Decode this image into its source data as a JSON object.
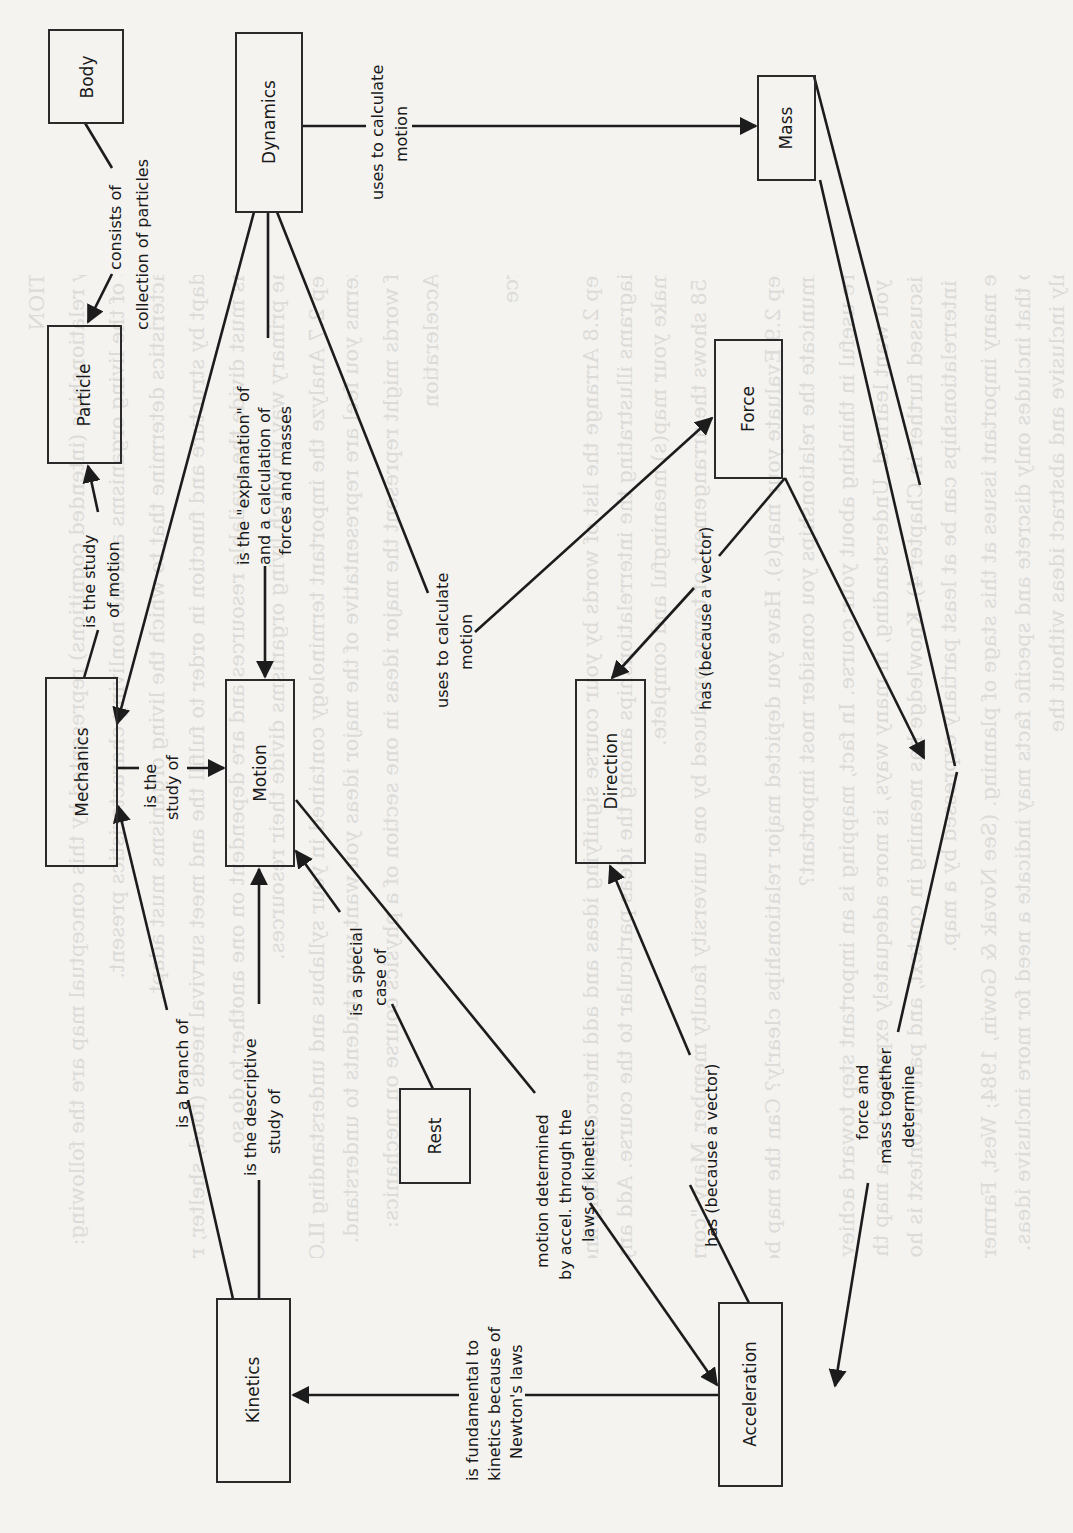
{
  "figure": {
    "orientation": "rotated 90 degrees counter-clockwise",
    "colors": {
      "background": "#f4f3f0",
      "ink": "#1c1c1c",
      "bleed_through": "#c9c8c4"
    }
  },
  "nodes": {
    "body": "Body",
    "dynamics": "Dynamics",
    "mass": "Mass",
    "particle": "Particle",
    "force": "Force",
    "mechanics": "Mechanics",
    "motion": "Motion",
    "direction": "Direction",
    "rest": "Rest",
    "kinetics": "Kinetics",
    "acceleration": "Acceleration"
  },
  "edges": {
    "body_particle": [
      "consists of",
      "collection of particles"
    ],
    "dynamics_mass": [
      "uses to calculate",
      "motion"
    ],
    "dynamics_motion": [
      "is the \"explanation\" of",
      "and a calculation of",
      "forces and masses"
    ],
    "dynamics_force": [
      "uses to calculate",
      "motion"
    ],
    "mechanics_particle": [
      "is the study",
      "of motion"
    ],
    "mechanics_motion": [
      "is the",
      "study of"
    ],
    "force_direction": [
      "has  (because a vector)"
    ],
    "kinetics_mechanics": [
      "is a branch of"
    ],
    "kinetics_motion": [
      "is the descriptive",
      "study of"
    ],
    "rest_motion": [
      "is a special",
      "case of"
    ],
    "acceleration_motion": [
      "motion determined",
      "by accel. through the",
      "laws of kinetics"
    ],
    "acceleration_direction": [
      "has  (because a vector)"
    ],
    "force_mass_acceleration": [
      "force and",
      "mass together",
      "determine"
    ],
    "acceleration_kinetics": [
      "is fundamental to",
      "kinetics because of",
      "Newton's laws"
    ]
  },
  "bleed_through_text": [
    "SETTING A DIRECTION",
    "The highest priority relationships (intended cognitions) represented by this conceptual map are the following:",
    "Ecosystems consist of the living organisms and the nonliving characteristics present.",
    "The nonliving characteristics determine that to which the living organisms must adapt.",
    "Living organisms adapt by structure and function in order to fulfill the and meet survival needs (food, shelter, reproduction).",
    "The living organisms must divide the available resources and are dependent on one another to do so.",
    "The food chain is the primary way in which living organisms divide their resources.",
    "Course Planning Step 2.7  Analyze the important terminology contained in your syllabus and understanding ILOs and course outline and list all terms you feel are representative of the major ideas you want your students to understand.",
    "The following list of words might represent the major ideas in one section of a physics course on mechanics:",
    "Mechanics   Motion   Acceleration",
    "Body   Rest   Particle",
    "Mass   Dynamics   Force",
    "Kinetics   Direction",
    "Course Planning Step 2.8  Arrange the list of words by your course signifying ideas and add interconnecting lines until you have a diagram or set of diagrams illustrating the interrelationships among the ideas particular to the course. Add any ideas that you feel are needed to make your map(s) meaningful and complete.",
    "Figure 2.9 on page 58 shows the arrangement of terms produced by one university faculty member. Many \"correct\" arrangements are possible.",
    "Course Planning Step 2.9  Evaluate your map(s). Have you depicted major relationships clearly? Can the map be simplified and still effectively communicate the relationships you consider most important?",
    "Conceptual maps are useful in thinking about your course. In fact, mapping is an important step toward achieving a clear conception of what you want learned. Understanding, in many ways, is more adequately expressed as a map than as a set of ILO statements (to be discussed further in Chapter 4). Knowledge has meaning in context, and part of context is how ideas are interrelated. These interrelationships can be at least partially expressed by a map.",
    "Maps can illuminate many important issues at this stage of planning. (See Novak & Gowin, 1984; West, Farmer, & Wolff, 1991.) For example, a map that includes only discrete and specific facts may indicate a need for more inclusive ideas. On the other hand, a map may show only inclusive and abstract ideas without the"
  ]
}
